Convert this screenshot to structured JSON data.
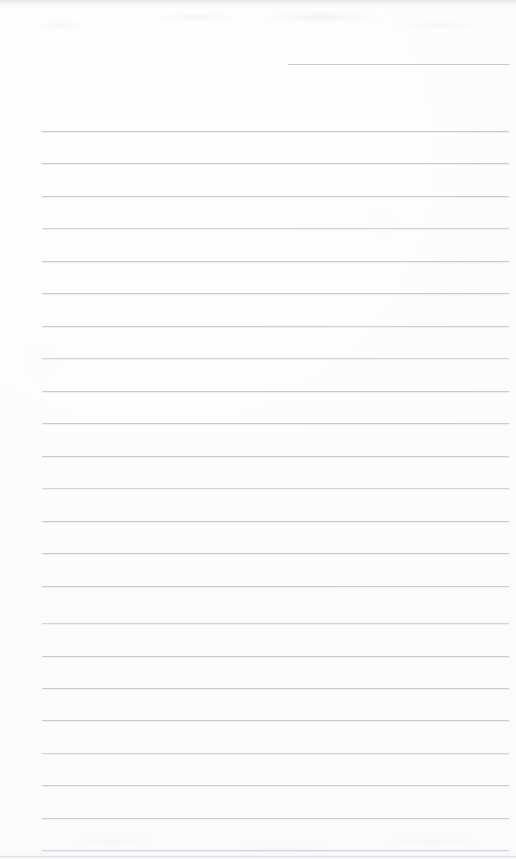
{
  "document": {
    "type": "scanned-lined-notepad-page",
    "title": "Blank lined notepad page",
    "description": "Scanned blank ruled writing paper with no handwriting or printed text",
    "width": 516,
    "height": 859,
    "page_background_color": "#fdfdfd",
    "rule_color": "#c9c9ce",
    "text_content": "",
    "handwriting_present": "no",
    "visible_text_count": 0
  },
  "layout": {
    "rule_left_x": 42,
    "rule_right_x": 509,
    "rule_spacing_px": 32.5,
    "first_full_rule_y": 131,
    "full_rule_count": 23,
    "top_margin_px": 131,
    "left_margin_px": 42,
    "right_margin_px": 7
  },
  "rules": {
    "header_rule": {
      "label": "header-rule",
      "x": 288,
      "y": 64,
      "width": 221
    },
    "body_rules": [
      {
        "y": 131,
        "x": 42,
        "width": 467,
        "tone": "normal"
      },
      {
        "y": 163,
        "x": 42,
        "width": 467,
        "tone": "normal"
      },
      {
        "y": 196,
        "x": 42,
        "width": 467,
        "tone": "normal"
      },
      {
        "y": 228,
        "x": 42,
        "width": 467,
        "tone": "soft"
      },
      {
        "y": 261,
        "x": 42,
        "width": 467,
        "tone": "normal"
      },
      {
        "y": 293,
        "x": 42,
        "width": 467,
        "tone": "normal"
      },
      {
        "y": 326,
        "x": 42,
        "width": 467,
        "tone": "normal"
      },
      {
        "y": 358,
        "x": 42,
        "width": 467,
        "tone": "soft"
      },
      {
        "y": 391,
        "x": 42,
        "width": 467,
        "tone": "normal"
      },
      {
        "y": 423,
        "x": 42,
        "width": 467,
        "tone": "normal"
      },
      {
        "y": 456,
        "x": 42,
        "width": 467,
        "tone": "normal"
      },
      {
        "y": 488,
        "x": 42,
        "width": 467,
        "tone": "soft"
      },
      {
        "y": 521,
        "x": 42,
        "width": 467,
        "tone": "normal"
      },
      {
        "y": 553,
        "x": 42,
        "width": 467,
        "tone": "normal"
      },
      {
        "y": 586,
        "x": 42,
        "width": 467,
        "tone": "normal"
      },
      {
        "y": 623,
        "x": 42,
        "width": 467,
        "tone": "soft"
      },
      {
        "y": 656,
        "x": 42,
        "width": 467,
        "tone": "normal"
      },
      {
        "y": 688,
        "x": 42,
        "width": 467,
        "tone": "normal"
      },
      {
        "y": 720,
        "x": 42,
        "width": 467,
        "tone": "normal"
      },
      {
        "y": 753,
        "x": 42,
        "width": 467,
        "tone": "soft"
      },
      {
        "y": 785,
        "x": 42,
        "width": 467,
        "tone": "normal"
      },
      {
        "y": 818,
        "x": 42,
        "width": 467,
        "tone": "normal"
      },
      {
        "y": 850,
        "x": 42,
        "width": 467,
        "tone": "soft"
      }
    ],
    "bottom_faint_rule": {
      "y": 856,
      "x": 0,
      "width": 516
    }
  },
  "artifacts": {
    "top_scan_band": "dark smudge band along top edge",
    "bottom_scan_band": "faint speckle band along bottom edge"
  }
}
